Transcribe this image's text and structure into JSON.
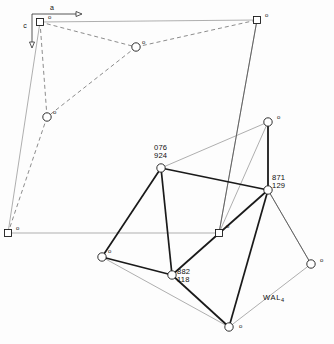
{
  "diagram": {
    "title": "WAL4",
    "axes": {
      "x_label": "a",
      "y_label": "c",
      "origin_marker": "o"
    },
    "colors": {
      "background": "#fdfdfd",
      "thin_edge": "#8d8d8d",
      "medium_edge": "#5a5a5a",
      "bold_edge": "#1a1a1a",
      "dashed_edge": "#6f6f6f",
      "node_fill": "#ffffff",
      "node_stroke": "#1a1a1a",
      "text": "#111111"
    },
    "area_label": {
      "text": "WAL",
      "subscript": "4",
      "x": 263,
      "y": 300
    },
    "point_labels": [
      {
        "id": "label-076-924",
        "line1": "076",
        "line2": "924",
        "x": 154,
        "y": 150
      },
      {
        "id": "label-871-129",
        "line1": "871",
        "line2": "129",
        "x": 272,
        "y": 180
      },
      {
        "id": "label-882-118",
        "line1": "882",
        "line2": "118",
        "x": 177,
        "y": 274
      }
    ],
    "o_marks": [
      {
        "x": 48,
        "y": 19
      },
      {
        "x": 265,
        "y": 17
      },
      {
        "x": 142,
        "y": 44
      },
      {
        "x": 53,
        "y": 114
      },
      {
        "x": 16,
        "y": 230
      },
      {
        "x": 226,
        "y": 228
      },
      {
        "x": 277,
        "y": 119
      },
      {
        "x": 320,
        "y": 262
      },
      {
        "x": 239,
        "y": 328
      },
      {
        "x": 108,
        "y": 253
      }
    ],
    "nodes": [
      {
        "id": "n-sq-tl",
        "shape": "square",
        "x": 40,
        "y": 22,
        "size": 7
      },
      {
        "id": "n-sq-tr",
        "shape": "square",
        "x": 257,
        "y": 20,
        "size": 7
      },
      {
        "id": "n-sq-bl",
        "shape": "square",
        "x": 8,
        "y": 233,
        "size": 7
      },
      {
        "id": "n-sq-br",
        "shape": "square",
        "x": 219,
        "y": 233,
        "size": 7
      },
      {
        "id": "n-mid-top",
        "shape": "circle",
        "x": 136,
        "y": 47,
        "r": 4.2
      },
      {
        "id": "n-mid-left",
        "shape": "circle",
        "x": 47,
        "y": 117,
        "r": 4.2
      },
      {
        "id": "n-076",
        "shape": "circle",
        "x": 161,
        "y": 168,
        "r": 4.2
      },
      {
        "id": "n-871",
        "shape": "circle",
        "x": 268,
        "y": 190,
        "r": 4.2
      },
      {
        "id": "n-882",
        "shape": "circle",
        "x": 172,
        "y": 275,
        "r": 4.2
      },
      {
        "id": "n-right-up",
        "shape": "circle",
        "x": 268,
        "y": 122,
        "r": 4.2
      },
      {
        "id": "n-right-lo",
        "shape": "circle",
        "x": 311,
        "y": 264,
        "r": 4.2
      },
      {
        "id": "n-bottom",
        "shape": "circle",
        "x": 229,
        "y": 327,
        "r": 4.2
      },
      {
        "id": "n-left-lo",
        "shape": "circle",
        "x": 102,
        "y": 257,
        "r": 4.2
      }
    ],
    "edges_thin": [
      {
        "from": "n-sq-tl",
        "to": "n-sq-tr"
      },
      {
        "from": "n-sq-tl",
        "to": "n-sq-bl"
      },
      {
        "from": "n-sq-bl",
        "to": "n-sq-br"
      },
      {
        "from": "n-sq-br",
        "to": "n-sq-tr"
      },
      {
        "from": "n-sq-br",
        "to": "n-right-up"
      },
      {
        "from": "n-sq-br",
        "to": "n-882"
      },
      {
        "from": "n-left-lo",
        "to": "n-076"
      },
      {
        "from": "n-left-lo",
        "to": "n-bottom"
      },
      {
        "from": "n-right-up",
        "to": "n-076"
      },
      {
        "from": "n-right-lo",
        "to": "n-bottom"
      },
      {
        "from": "n-right-lo",
        "to": "n-871"
      }
    ],
    "edges_medium": [
      {
        "from": "n-sq-tr",
        "to": "n-sq-br"
      },
      {
        "from": "n-right-up",
        "to": "n-871"
      },
      {
        "from": "n-871",
        "to": "n-right-lo"
      },
      {
        "from": "n-882",
        "to": "n-bottom"
      }
    ],
    "edges_bold": [
      {
        "from": "n-076",
        "to": "n-871"
      },
      {
        "from": "n-076",
        "to": "n-882"
      },
      {
        "from": "n-076",
        "to": "n-left-lo"
      },
      {
        "from": "n-871",
        "to": "n-882"
      },
      {
        "from": "n-871",
        "to": "n-bottom"
      },
      {
        "from": "n-871",
        "to": "n-right-up"
      },
      {
        "from": "n-882",
        "to": "n-left-lo"
      },
      {
        "from": "n-882",
        "to": "n-bottom"
      }
    ],
    "edges_dashed": [
      {
        "from": "n-sq-tl",
        "to": "n-mid-top"
      },
      {
        "from": "n-mid-top",
        "to": "n-sq-tr"
      },
      {
        "from": "n-mid-top",
        "to": "n-mid-left"
      },
      {
        "from": "n-sq-tl",
        "to": "n-mid-left"
      },
      {
        "from": "n-mid-left",
        "to": "n-sq-bl"
      }
    ]
  }
}
